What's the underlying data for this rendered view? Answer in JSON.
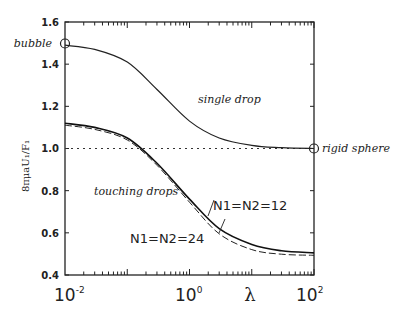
{
  "chart_data": {
    "type": "line",
    "title": "",
    "xlabel": "λ",
    "ylabel": "8πμaU₁/F₁",
    "xscale": "log",
    "xlim": [
      0.01,
      100
    ],
    "ylim": [
      0.4,
      1.6
    ],
    "grid": false,
    "x_tick_labels": [
      "10⁻²",
      "10⁰",
      "10²"
    ],
    "y_tick_labels": [
      "0.4",
      "0.6",
      "0.8",
      "1.0",
      "1.2",
      "1.4",
      "1.6"
    ],
    "reference_line": {
      "y": 1.0,
      "style": "dotted"
    },
    "series": [
      {
        "name": "single drop",
        "style": "solid",
        "x": [
          0.01,
          0.03,
          0.1,
          0.3,
          1,
          3,
          10,
          30,
          100
        ],
        "values": [
          1.49,
          1.47,
          1.41,
          1.28,
          1.13,
          1.05,
          1.015,
          1.004,
          1.0
        ]
      },
      {
        "name": "touching drops N1=N2=12",
        "style": "solid",
        "x": [
          0.01,
          0.03,
          0.1,
          0.3,
          1,
          3,
          10,
          30,
          100
        ],
        "values": [
          1.12,
          1.1,
          1.05,
          0.93,
          0.76,
          0.62,
          0.545,
          0.515,
          0.505
        ]
      },
      {
        "name": "touching drops N1=N2=24",
        "style": "dashed",
        "x": [
          0.01,
          0.03,
          0.1,
          0.3,
          1,
          3,
          10,
          30,
          100
        ],
        "values": [
          1.12,
          1.1,
          1.05,
          0.93,
          0.755,
          0.605,
          0.53,
          0.508,
          0.503
        ]
      }
    ],
    "annotations": [
      {
        "text": "bubble",
        "x": 0.01,
        "y": 1.5,
        "marker": "circle"
      },
      {
        "text": "rigid sphere",
        "x": 100,
        "y": 1.0,
        "marker": "circle"
      },
      {
        "text": "single drop",
        "x": 1.5,
        "y": 1.17
      },
      {
        "text": "touching drops",
        "x": 0.04,
        "y": 0.77
      },
      {
        "text": "N1=N2=12",
        "x": 3,
        "y": 0.72
      },
      {
        "text": "N1=N2=24",
        "x": 0.8,
        "y": 0.57
      }
    ]
  },
  "labels": {
    "bubble": "bubble",
    "rigid_sphere": "rigid sphere",
    "single_drop": "single drop",
    "touching_drops": "touching drops",
    "n12": "N1=N2=12",
    "n24": "N1=N2=24",
    "xlabel": "λ",
    "ylabel": "8πμaU₁/F₁"
  },
  "axes": {
    "y_ticks": [
      "1.6",
      "1.4",
      "1.2",
      "1.0",
      "0.8",
      "0.6",
      "0.4"
    ],
    "x_ticks": [
      {
        "base": "10",
        "exp": "-2"
      },
      {
        "base": "10",
        "exp": "0"
      },
      {
        "base": "10",
        "exp": "2"
      }
    ]
  }
}
